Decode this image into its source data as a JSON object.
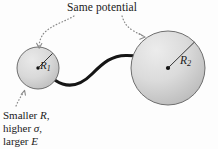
{
  "figure": {
    "title_annotation": "Same potential",
    "background_color": "#fdfdfd",
    "sphere_fill_color": "#d6d6d6",
    "sphere_edge_color": "#6e6e6e",
    "wire_color": "#151515",
    "leader_color": "#8a8a8a",
    "text_color": "#1a1a1a"
  },
  "small_sphere": {
    "radius_label": "R",
    "radius_subscript": "1",
    "center_x": 38,
    "center_y": 68,
    "radius_px": 21
  },
  "large_sphere": {
    "radius_label": "R",
    "radius_subscript": "2",
    "center_x": 168,
    "center_y": 68,
    "radius_px": 37
  },
  "note": {
    "line1_prefix": "Smaller ",
    "line1_symbol": "R",
    "line1_suffix": ",",
    "line2_prefix": "higher ",
    "line2_symbol": "σ",
    "line2_suffix": ",",
    "line3_prefix": "larger ",
    "line3_symbol": "E",
    "line3_suffix": ""
  }
}
